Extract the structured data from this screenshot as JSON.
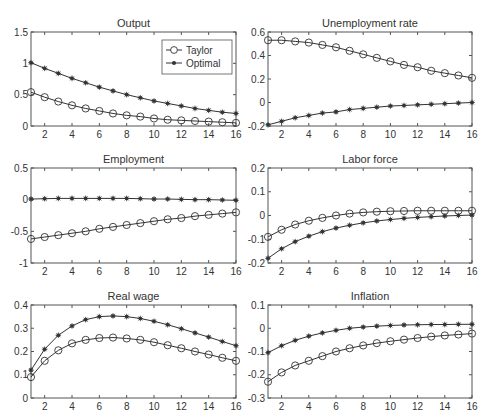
{
  "chart_data": [
    {
      "type": "line",
      "title": "Output",
      "x": [
        1,
        2,
        3,
        4,
        5,
        6,
        7,
        8,
        9,
        10,
        11,
        12,
        13,
        14,
        15,
        16
      ],
      "xticks": [
        2,
        4,
        6,
        8,
        10,
        12,
        14,
        16
      ],
      "ylim": [
        0,
        1.5
      ],
      "yticks": [
        0,
        0.5,
        1,
        1.5
      ],
      "ytick_labels": [
        "0",
        "0.5",
        "1",
        "1.5"
      ],
      "series": [
        {
          "name": "Taylor",
          "marker": "circle",
          "values": [
            0.54,
            0.46,
            0.39,
            0.33,
            0.28,
            0.24,
            0.2,
            0.17,
            0.15,
            0.12,
            0.1,
            0.09,
            0.08,
            0.07,
            0.06,
            0.05
          ]
        },
        {
          "name": "Optimal",
          "marker": "star",
          "values": [
            1.01,
            0.92,
            0.84,
            0.76,
            0.69,
            0.62,
            0.56,
            0.5,
            0.45,
            0.4,
            0.36,
            0.32,
            0.28,
            0.25,
            0.22,
            0.2
          ]
        }
      ],
      "legend": {
        "position": "upper right",
        "entries": [
          "Taylor",
          "Optimal"
        ]
      }
    },
    {
      "type": "line",
      "title": "Unemployment rate",
      "x": [
        1,
        2,
        3,
        4,
        5,
        6,
        7,
        8,
        9,
        10,
        11,
        12,
        13,
        14,
        15,
        16
      ],
      "xticks": [
        2,
        4,
        6,
        8,
        10,
        12,
        14,
        16
      ],
      "ylim": [
        -0.2,
        0.6
      ],
      "yticks": [
        -0.2,
        0,
        0.2,
        0.4,
        0.6
      ],
      "ytick_labels": [
        "-0.2",
        "0",
        "0.2",
        "0.4",
        "0.6"
      ],
      "series": [
        {
          "name": "Taylor",
          "marker": "circle",
          "values": [
            0.53,
            0.53,
            0.52,
            0.51,
            0.49,
            0.47,
            0.44,
            0.41,
            0.38,
            0.35,
            0.32,
            0.3,
            0.27,
            0.25,
            0.23,
            0.21
          ]
        },
        {
          "name": "Optimal",
          "marker": "star",
          "values": [
            -0.19,
            -0.16,
            -0.13,
            -0.11,
            -0.09,
            -0.08,
            -0.06,
            -0.05,
            -0.04,
            -0.03,
            -0.025,
            -0.02,
            -0.015,
            -0.01,
            -0.005,
            0.0
          ]
        }
      ]
    },
    {
      "type": "line",
      "title": "Employment",
      "x": [
        1,
        2,
        3,
        4,
        5,
        6,
        7,
        8,
        9,
        10,
        11,
        12,
        13,
        14,
        15,
        16
      ],
      "xticks": [
        2,
        4,
        6,
        8,
        10,
        12,
        14,
        16
      ],
      "ylim": [
        -1,
        0.5
      ],
      "yticks": [
        -1,
        -0.5,
        0,
        0.5
      ],
      "ytick_labels": [
        "-1",
        "-0.5",
        "0",
        "0.5"
      ],
      "series": [
        {
          "name": "Taylor",
          "marker": "circle",
          "values": [
            -0.62,
            -0.59,
            -0.56,
            -0.53,
            -0.5,
            -0.46,
            -0.43,
            -0.4,
            -0.37,
            -0.34,
            -0.31,
            -0.29,
            -0.26,
            -0.24,
            -0.22,
            -0.2
          ]
        },
        {
          "name": "Optimal",
          "marker": "star",
          "values": [
            0.01,
            0.015,
            0.02,
            0.02,
            0.02,
            0.02,
            0.02,
            0.02,
            0.015,
            0.01,
            0.01,
            0.005,
            0.0,
            0.0,
            -0.005,
            -0.01
          ]
        }
      ]
    },
    {
      "type": "line",
      "title": "Labor force",
      "x": [
        1,
        2,
        3,
        4,
        5,
        6,
        7,
        8,
        9,
        10,
        11,
        12,
        13,
        14,
        15,
        16
      ],
      "xticks": [
        2,
        4,
        6,
        8,
        10,
        12,
        14,
        16
      ],
      "ylim": [
        -0.2,
        0.2
      ],
      "yticks": [
        -0.2,
        -0.1,
        0,
        0.1,
        0.2
      ],
      "ytick_labels": [
        "-0.2",
        "-0.1",
        "0",
        "0.1",
        "0.2"
      ],
      "series": [
        {
          "name": "Taylor",
          "marker": "circle",
          "values": [
            -0.09,
            -0.06,
            -0.038,
            -0.022,
            -0.01,
            0.0,
            0.008,
            0.013,
            0.016,
            0.018,
            0.019,
            0.02,
            0.02,
            0.02,
            0.02,
            0.02
          ]
        },
        {
          "name": "Optimal",
          "marker": "star",
          "values": [
            -0.18,
            -0.14,
            -0.11,
            -0.087,
            -0.068,
            -0.053,
            -0.041,
            -0.031,
            -0.023,
            -0.017,
            -0.012,
            -0.008,
            -0.005,
            -0.002,
            0.0,
            0.002
          ]
        }
      ]
    },
    {
      "type": "line",
      "title": "Real wage",
      "x": [
        1,
        2,
        3,
        4,
        5,
        6,
        7,
        8,
        9,
        10,
        11,
        12,
        13,
        14,
        15,
        16
      ],
      "xticks": [
        2,
        4,
        6,
        8,
        10,
        12,
        14,
        16
      ],
      "ylim": [
        0,
        0.4
      ],
      "yticks": [
        0,
        0.1,
        0.2,
        0.3,
        0.4
      ],
      "ytick_labels": [
        "0",
        "0.1",
        "0.2",
        "0.3",
        "0.4"
      ],
      "series": [
        {
          "name": "Taylor",
          "marker": "circle",
          "values": [
            0.09,
            0.16,
            0.205,
            0.235,
            0.25,
            0.258,
            0.26,
            0.256,
            0.25,
            0.24,
            0.227,
            0.214,
            0.2,
            0.187,
            0.173,
            0.16
          ]
        },
        {
          "name": "Optimal",
          "marker": "star",
          "values": [
            0.12,
            0.21,
            0.27,
            0.31,
            0.337,
            0.35,
            0.353,
            0.35,
            0.342,
            0.33,
            0.315,
            0.298,
            0.28,
            0.262,
            0.243,
            0.225
          ]
        }
      ]
    },
    {
      "type": "line",
      "title": "Inflation",
      "x": [
        1,
        2,
        3,
        4,
        5,
        6,
        7,
        8,
        9,
        10,
        11,
        12,
        13,
        14,
        15,
        16
      ],
      "xticks": [
        2,
        4,
        6,
        8,
        10,
        12,
        14,
        16
      ],
      "ylim": [
        -0.3,
        0.1
      ],
      "yticks": [
        -0.3,
        -0.2,
        -0.1,
        0,
        0.1
      ],
      "ytick_labels": [
        "-0.3",
        "-0.2",
        "-0.1",
        "0",
        "0.1"
      ],
      "series": [
        {
          "name": "Taylor",
          "marker": "circle",
          "values": [
            -0.23,
            -0.19,
            -0.16,
            -0.14,
            -0.12,
            -0.1,
            -0.086,
            -0.074,
            -0.064,
            -0.056,
            -0.049,
            -0.042,
            -0.036,
            -0.031,
            -0.027,
            -0.023
          ]
        },
        {
          "name": "Optimal",
          "marker": "star",
          "values": [
            -0.105,
            -0.075,
            -0.052,
            -0.034,
            -0.02,
            -0.009,
            0.0,
            0.005,
            0.009,
            0.012,
            0.014,
            0.015,
            0.016,
            0.016,
            0.017,
            0.017
          ]
        }
      ]
    }
  ],
  "style": {
    "line_color": "#333333",
    "axis_color": "#555555",
    "background": "#ffffff"
  }
}
